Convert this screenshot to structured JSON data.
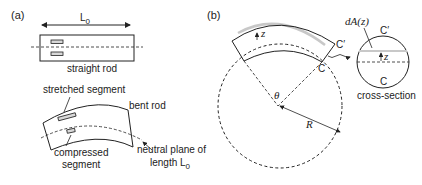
{
  "panel_a": {
    "label": "(a)",
    "length_label": "L",
    "length_sub": "0",
    "straight_rod_label": "straight rod",
    "stretched_label": "stretched segment",
    "bent_rod_label": "bent rod",
    "compressed_label_1": "compressed",
    "compressed_label_2": "segment",
    "neutral_label_1": "neutral plane of",
    "neutral_label_2": "length L",
    "neutral_label_sub": "0"
  },
  "panel_b": {
    "label": "(b)",
    "z_label": "z",
    "c_prime_label": "C′",
    "c_label": "C",
    "theta_label": "θ",
    "r_label": "R",
    "da_label": "dA(z)",
    "cs_c_prime_label": "C′",
    "cs_c_label": "C",
    "cs_z_label": "z",
    "cross_section_label": "cross-section"
  },
  "colors": {
    "stroke": "#222222",
    "highlight": "#c8c8c8",
    "segment_fill": "#d8d8d8"
  }
}
